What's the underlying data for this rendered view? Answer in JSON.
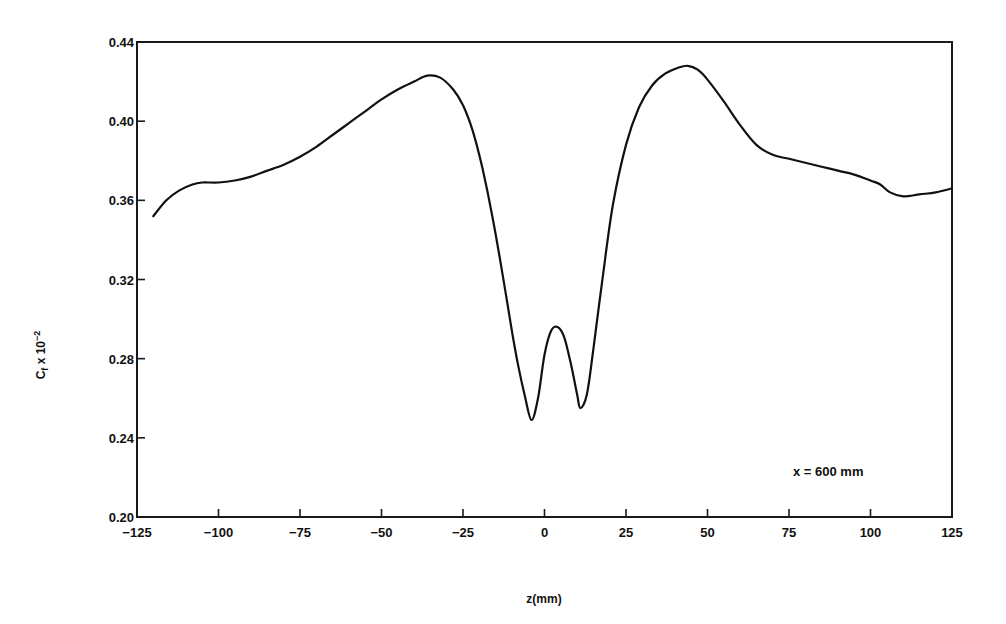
{
  "chart_data": {
    "type": "line",
    "title": "",
    "xlabel": "z(mm)",
    "ylabel": "Cf x 10^-2",
    "ylabel_parts": {
      "main": "C",
      "sub": "f",
      "rest": " x 10",
      "sup": "−2"
    },
    "xlim": [
      -125,
      125
    ],
    "ylim": [
      0.2,
      0.44
    ],
    "grid": false,
    "legend": null,
    "annotation": "x = 600 mm",
    "x_ticks": [
      -125,
      -100,
      -75,
      -50,
      -25,
      0,
      25,
      50,
      75,
      100,
      125
    ],
    "x_tick_labels": [
      "−125",
      "−100",
      "−75",
      "−50",
      "−25",
      "0",
      "25",
      "50",
      "75",
      "100",
      "125"
    ],
    "y_ticks": [
      0.2,
      0.24,
      0.28,
      0.32,
      0.36,
      0.4,
      0.44
    ],
    "y_tick_labels": [
      "0.20",
      "0.24",
      "0.28",
      "0.32",
      "0.36",
      "0.40",
      "0.44"
    ],
    "series": [
      {
        "name": "Cf at x = 600 mm",
        "x": [
          -120,
          -116,
          -112,
          -108,
          -105,
          -100,
          -95,
          -90,
          -85,
          -80,
          -75,
          -70,
          -65,
          -60,
          -55,
          -50,
          -45,
          -40,
          -36,
          -32,
          -28,
          -25,
          -22,
          -19,
          -16,
          -13,
          -10,
          -8,
          -6,
          -4,
          -2,
          0,
          2,
          4,
          6,
          8,
          10,
          11,
          13,
          15,
          18,
          21,
          25,
          29,
          33,
          37,
          41,
          44,
          47,
          50,
          55,
          60,
          65,
          70,
          75,
          80,
          85,
          90,
          95,
          100,
          103,
          106,
          110,
          115,
          120,
          125
        ],
        "y": [
          0.352,
          0.36,
          0.365,
          0.368,
          0.369,
          0.369,
          0.37,
          0.372,
          0.375,
          0.378,
          0.382,
          0.387,
          0.393,
          0.399,
          0.405,
          0.411,
          0.416,
          0.42,
          0.423,
          0.422,
          0.416,
          0.408,
          0.395,
          0.376,
          0.352,
          0.324,
          0.294,
          0.276,
          0.261,
          0.249,
          0.26,
          0.282,
          0.294,
          0.296,
          0.291,
          0.278,
          0.262,
          0.255,
          0.262,
          0.285,
          0.323,
          0.358,
          0.388,
          0.407,
          0.418,
          0.424,
          0.427,
          0.428,
          0.426,
          0.421,
          0.41,
          0.398,
          0.388,
          0.383,
          0.381,
          0.379,
          0.377,
          0.375,
          0.373,
          0.37,
          0.368,
          0.364,
          0.362,
          0.363,
          0.364,
          0.366
        ]
      }
    ]
  }
}
